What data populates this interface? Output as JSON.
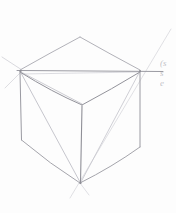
{
  "document": {
    "title": "Cube Perspective Sketch",
    "medium": "pencil on paper",
    "background_color": "#fdfdfd",
    "stroke_color": "#8c8c93",
    "light_stroke_color": "#c8c8ce"
  },
  "annotation": {
    "line1": "(s",
    "line2": "s",
    "line3": "e",
    "color": "#b9b9bd"
  },
  "drawing": {
    "subject": "wireframe-cube-two-point-perspective",
    "vertices": {
      "top_back": "80,37",
      "left": "20,71",
      "right": "140,71",
      "front_top": "82,105",
      "bottom_left": "22,140",
      "bottom_right": "140,148",
      "bottom_front": "80,183"
    },
    "strokes": [
      {
        "name": "top-face-back-left-edge",
        "path": "M 20 71 L 80 37",
        "weight": 0.8,
        "tone": "medium"
      },
      {
        "name": "top-face-back-right-edge",
        "path": "M 80 37 L 140 71",
        "weight": 0.8,
        "tone": "medium"
      },
      {
        "name": "top-face-front-left-edge",
        "path": "M 20 71 L 82 105",
        "weight": 0.9,
        "tone": "medium"
      },
      {
        "name": "top-face-front-right-edge",
        "path": "M 82 105 L 140 71",
        "weight": 0.9,
        "tone": "medium"
      },
      {
        "name": "horizon-guideline",
        "path": "M 17 70 L 163 71",
        "weight": 0.9,
        "tone": "medium"
      },
      {
        "name": "vertical-edge-left",
        "path": "M 20 71 L 22 140",
        "weight": 0.9,
        "tone": "medium"
      },
      {
        "name": "vertical-edge-front",
        "path": "M 82 105 L 80 183",
        "weight": 0.9,
        "tone": "medium"
      },
      {
        "name": "vertical-edge-right",
        "path": "M 140 71 L 140 148",
        "weight": 0.9,
        "tone": "medium"
      },
      {
        "name": "bottom-edge-left",
        "path": "M 22 140 L 80 183",
        "weight": 0.8,
        "tone": "medium"
      },
      {
        "name": "bottom-edge-right",
        "path": "M 80 183 L 140 148",
        "weight": 0.8,
        "tone": "medium"
      },
      {
        "name": "face-diagonal-left",
        "path": "M 20 71 L 80 183",
        "weight": 0.7,
        "tone": "light"
      },
      {
        "name": "face-diagonal-right",
        "path": "M 140 71 L 80 183",
        "weight": 0.7,
        "tone": "light"
      },
      {
        "name": "construction-ray-upper-left",
        "path": "M 20 71 L 3 58",
        "weight": 0.6,
        "tone": "light"
      },
      {
        "name": "construction-ray-lower-left",
        "path": "M 20 71 L 5 86",
        "weight": 0.6,
        "tone": "light"
      },
      {
        "name": "construction-ray-left-to-front-top",
        "path": "M 20 71 L 82 105",
        "weight": 0.6,
        "tone": "light"
      },
      {
        "name": "long-diagonal-guideline",
        "path": "M 70 198 L 171 29",
        "weight": 0.7,
        "tone": "light"
      },
      {
        "name": "construction-ray-right-inner",
        "path": "M 140 71 L 20 73",
        "weight": 0.5,
        "tone": "light"
      },
      {
        "name": "bottom-vertex-tick",
        "path": "M 80 183 L 88 194",
        "weight": 0.6,
        "tone": "light"
      }
    ]
  }
}
